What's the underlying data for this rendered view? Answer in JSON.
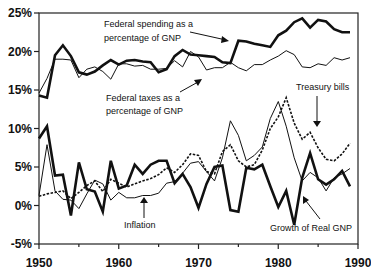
{
  "chart_data": {
    "type": "line",
    "title": "",
    "xlabel": "",
    "ylabel": "",
    "xlim": [
      1950,
      1990
    ],
    "ylim": [
      -5,
      25
    ],
    "grid": false,
    "x_ticks": [
      "1950",
      "1960",
      "1970",
      "1980",
      "1990"
    ],
    "y_ticks": [
      "25%",
      "20%",
      "15%",
      "10%",
      "5%",
      "0%",
      "-5%"
    ],
    "x": [
      1950,
      1951,
      1952,
      1953,
      1954,
      1955,
      1956,
      1957,
      1958,
      1959,
      1960,
      1961,
      1962,
      1963,
      1964,
      1965,
      1966,
      1967,
      1968,
      1969,
      1970,
      1971,
      1972,
      1973,
      1974,
      1975,
      1976,
      1977,
      1978,
      1979,
      1980,
      1981,
      1982,
      1983,
      1984,
      1985,
      1986,
      1987,
      1988,
      1989
    ],
    "series": [
      {
        "name": "Federal spending as a percentage of GNP",
        "style": "thick",
        "values": [
          14.3,
          14.0,
          19.5,
          20.8,
          19.4,
          17.3,
          17.0,
          17.4,
          18.2,
          18.9,
          18.3,
          18.8,
          18.9,
          18.7,
          18.6,
          17.3,
          17.7,
          19.4,
          20.2,
          19.6,
          19.5,
          19.4,
          19.3,
          18.6,
          18.5,
          21.4,
          21.3,
          21.0,
          20.8,
          20.6,
          22.1,
          22.7,
          23.8,
          24.3,
          23.1,
          24.1,
          23.9,
          22.9,
          22.5,
          22.5
        ]
      },
      {
        "name": "Federal taxes as a percentage of GNP",
        "style": "thin",
        "values": [
          14.6,
          16.5,
          19.0,
          19.0,
          18.9,
          16.6,
          17.7,
          18.0,
          17.4,
          16.4,
          18.4,
          18.4,
          18.1,
          18.2,
          17.7,
          17.7,
          17.8,
          18.8,
          18.0,
          20.0,
          19.3,
          17.6,
          17.9,
          17.9,
          18.6,
          17.9,
          17.5,
          18.3,
          18.3,
          18.9,
          19.4,
          20.1,
          19.6,
          18.0,
          17.9,
          18.4,
          18.2,
          19.2,
          18.9,
          19.2
        ]
      },
      {
        "name": "Treasury bills",
        "style": "dashed",
        "values": [
          1.2,
          1.5,
          1.7,
          1.9,
          0.9,
          1.7,
          2.6,
          3.2,
          1.8,
          3.4,
          2.9,
          2.4,
          2.8,
          3.2,
          3.5,
          4.0,
          4.9,
          4.3,
          5.3,
          6.7,
          6.5,
          4.4,
          4.1,
          7.0,
          7.9,
          5.8,
          5.0,
          5.3,
          7.2,
          10.0,
          11.5,
          14.0,
          10.7,
          8.6,
          9.5,
          7.5,
          6.0,
          5.8,
          6.7,
          8.1
        ]
      },
      {
        "name": "Inflation",
        "style": "thin",
        "values": [
          1.3,
          7.9,
          1.9,
          0.8,
          0.7,
          -0.4,
          1.5,
          3.3,
          2.8,
          0.7,
          1.7,
          1.0,
          1.0,
          1.3,
          1.3,
          1.6,
          2.9,
          3.1,
          4.2,
          5.5,
          5.7,
          4.4,
          3.2,
          6.2,
          11.0,
          9.1,
          5.8,
          6.5,
          7.6,
          11.3,
          13.5,
          10.3,
          6.2,
          3.2,
          4.3,
          3.6,
          1.9,
          3.6,
          4.1,
          4.8
        ]
      },
      {
        "name": "Growth of Real GNP",
        "style": "thick",
        "values": [
          8.7,
          10.3,
          3.9,
          4.0,
          -1.3,
          5.6,
          2.1,
          1.8,
          -0.8,
          5.8,
          2.2,
          2.6,
          5.3,
          4.1,
          5.3,
          5.8,
          5.8,
          2.9,
          4.1,
          2.4,
          -0.3,
          2.8,
          5.0,
          5.2,
          -0.6,
          -0.8,
          4.9,
          4.7,
          5.3,
          2.5,
          -0.2,
          1.9,
          -2.5,
          3.6,
          6.8,
          3.4,
          2.7,
          3.4,
          4.5,
          2.5
        ]
      }
    ],
    "annotations": [
      {
        "text_lines": [
          "Federal spending as a",
          "percentage of GNP"
        ],
        "arrow_to": "Federal spending"
      },
      {
        "text_lines": [
          "Federal taxes as a",
          "percentage of GNP"
        ],
        "arrow_to": "Federal taxes"
      },
      {
        "text_lines": [
          "Treasury bills"
        ],
        "arrow_to": "Treasury bills"
      },
      {
        "text_lines": [
          "Inflation"
        ],
        "arrow_to": "Inflation"
      },
      {
        "text_lines": [
          "Growth of Real GNP"
        ],
        "arrow_to": "Growth of Real GNP"
      }
    ]
  }
}
